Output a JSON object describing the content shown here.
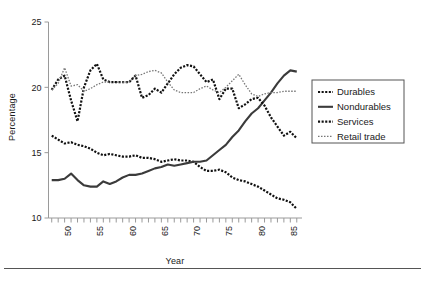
{
  "figure": {
    "name": "line-chart-employment-shares",
    "background": "#ffffff",
    "rule_color": "#555555"
  },
  "axes": {
    "ylabel": "Percentage",
    "xlabel": "Year",
    "y_ticks": [
      10,
      15,
      20,
      25
    ],
    "y_tick_labels": [
      "10",
      "15",
      "20",
      "25"
    ],
    "ylim": [
      10,
      25
    ],
    "xlim": [
      1946.5,
      1985.5
    ],
    "x_tick_labels": [
      "50",
      "55",
      "60",
      "65",
      "70",
      "75",
      "80",
      "85"
    ],
    "x_tick_label_years": [
      1950,
      1955,
      1960,
      1965,
      1970,
      1975,
      1980,
      1985
    ],
    "x_minor_tick_step": 1,
    "grid": false,
    "spines": [
      "left",
      "bottom"
    ],
    "x_tick_label_rotation": 90
  },
  "legend": {
    "position": "right",
    "border_color": "#555555",
    "entries": [
      {
        "label": "Durables",
        "style": "dotted-bold",
        "color": "#111111"
      },
      {
        "label": "Nondurables",
        "style": "solid",
        "color": "#3b3b3b"
      },
      {
        "label": "Services",
        "style": "dotted-bold",
        "color": "#111111"
      },
      {
        "label": "Retail trade",
        "style": "dotted-fine",
        "color": "#777777"
      }
    ]
  },
  "chart_data": {
    "type": "line",
    "title": "",
    "xlabel": "Year",
    "ylabel": "Percentage",
    "xlim": [
      1946.5,
      1985.5
    ],
    "ylim": [
      10,
      25
    ],
    "grid": false,
    "legend_position": "right",
    "x": [
      1947,
      1948,
      1949,
      1950,
      1951,
      1952,
      1953,
      1954,
      1955,
      1956,
      1957,
      1958,
      1959,
      1960,
      1961,
      1962,
      1963,
      1964,
      1965,
      1966,
      1967,
      1968,
      1969,
      1970,
      1971,
      1972,
      1973,
      1974,
      1975,
      1976,
      1977,
      1978,
      1979,
      1980,
      1981,
      1982,
      1983,
      1984,
      1985
    ],
    "series": [
      {
        "name": "Durables",
        "style": "dotted-bold",
        "color": "#111111",
        "values": [
          16.3,
          16.0,
          15.7,
          15.8,
          15.6,
          15.5,
          15.3,
          15.0,
          14.8,
          14.9,
          14.8,
          14.7,
          14.7,
          14.8,
          14.6,
          14.6,
          14.5,
          14.3,
          14.4,
          14.5,
          14.4,
          14.4,
          14.3,
          13.9,
          13.6,
          13.6,
          13.7,
          13.5,
          13.1,
          12.9,
          12.8,
          12.6,
          12.4,
          12.1,
          11.8,
          11.5,
          11.4,
          11.2,
          10.7
        ]
      },
      {
        "name": "Nondurables",
        "style": "solid",
        "color": "#3b3b3b",
        "values": [
          12.9,
          12.9,
          13.0,
          13.4,
          12.9,
          12.5,
          12.4,
          12.4,
          12.8,
          12.6,
          12.8,
          13.1,
          13.3,
          13.3,
          13.4,
          13.6,
          13.8,
          13.9,
          14.1,
          14.0,
          14.1,
          14.2,
          14.3,
          14.3,
          14.4,
          14.8,
          15.2,
          15.6,
          16.2,
          16.7,
          17.4,
          18.0,
          18.4,
          19.0,
          19.6,
          20.3,
          20.9,
          21.3,
          21.2
        ]
      },
      {
        "name": "Services",
        "style": "dotted-bold",
        "color": "#111111",
        "values": [
          19.8,
          20.6,
          20.9,
          19.0,
          17.4,
          20.0,
          21.3,
          21.8,
          20.6,
          20.4,
          20.4,
          20.4,
          20.4,
          20.9,
          19.2,
          19.4,
          19.9,
          19.6,
          20.3,
          21.0,
          21.5,
          21.7,
          21.6,
          21.0,
          20.4,
          20.6,
          19.1,
          19.9,
          19.9,
          18.4,
          18.7,
          19.1,
          19.2,
          18.6,
          17.7,
          17.0,
          16.3,
          16.6,
          16.1
        ]
      },
      {
        "name": "Retail trade",
        "style": "dotted-fine",
        "color": "#777777",
        "values": [
          19.8,
          20.3,
          21.5,
          20.1,
          20.2,
          19.7,
          19.9,
          20.2,
          20.4,
          20.4,
          20.4,
          20.4,
          20.4,
          20.9,
          21.0,
          21.2,
          21.3,
          21.1,
          20.4,
          19.8,
          19.6,
          19.6,
          19.6,
          19.9,
          20.1,
          19.8,
          19.6,
          20.0,
          20.5,
          21.0,
          20.2,
          19.5,
          19.3,
          19.5,
          19.6,
          19.6,
          19.7,
          19.7,
          19.7
        ]
      }
    ]
  }
}
